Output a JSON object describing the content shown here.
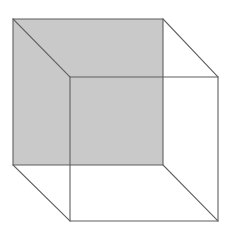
{
  "figure": {
    "type": "line-drawing",
    "width": 234,
    "height": 240,
    "background_color": "#ffffff",
    "stroke_color": "#5f5f5f",
    "stroke_width": 1.1,
    "shaded_face_color": "#c9c9c9",
    "shaded_face_name": "rear-square-face",
    "geometry": {
      "back_square": {
        "name": "back-face",
        "filled": true,
        "fill": "#c9c9c9",
        "points": "13,19 163,19 163,165 13,165",
        "corners": {
          "top_left": [
            13,
            19
          ],
          "top_right": [
            163,
            19
          ],
          "bottom_right": [
            163,
            165
          ],
          "bottom_left": [
            13,
            165
          ]
        }
      },
      "front_square": {
        "name": "front-face",
        "filled": false,
        "points": "70,77 218,77 218,221 70,221",
        "corners": {
          "top_left": [
            70,
            77
          ],
          "top_right": [
            218,
            77
          ],
          "bottom_right": [
            218,
            221
          ],
          "bottom_left": [
            70,
            221
          ]
        }
      },
      "connecting_edges": [
        {
          "name": "edge-top-left",
          "x1": 13,
          "y1": 19,
          "x2": 70,
          "y2": 77
        },
        {
          "name": "edge-top-right",
          "x1": 163,
          "y1": 19,
          "x2": 218,
          "y2": 77
        },
        {
          "name": "edge-bottom-right",
          "x1": 163,
          "y1": 165,
          "x2": 218,
          "y2": 221
        },
        {
          "name": "edge-bottom-left",
          "x1": 13,
          "y1": 165,
          "x2": 70,
          "y2": 221
        }
      ]
    }
  }
}
